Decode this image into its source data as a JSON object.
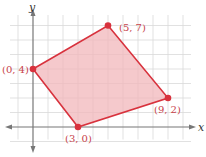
{
  "chart_data": {
    "type": "scatter",
    "title": "",
    "xlabel": "x",
    "ylabel": "y",
    "xlim": [
      -1,
      10
    ],
    "ylim": [
      -1,
      8
    ],
    "grid": true,
    "shape": "filled-polygon",
    "points": [
      {
        "x": 0,
        "y": 4,
        "label": "(0, 4)"
      },
      {
        "x": 5,
        "y": 7,
        "label": "(5, 7)"
      },
      {
        "x": 9,
        "y": 2,
        "label": "(9, 2)"
      },
      {
        "x": 3,
        "y": 0,
        "label": "(3, 0)"
      }
    ],
    "colors": {
      "polygon_fill": "#f2b7bb",
      "polygon_stroke": "#d8323d",
      "point": "#d8323d",
      "label": "#c8424a",
      "grid": "#d9d9d9",
      "axis": "#777777"
    }
  },
  "axes": {
    "x_label": "x",
    "y_label": "y"
  },
  "labels": {
    "p0": "(0, 4)",
    "p1": "(5, 7)",
    "p2": "(9, 2)",
    "p3": "(3, 0)"
  }
}
